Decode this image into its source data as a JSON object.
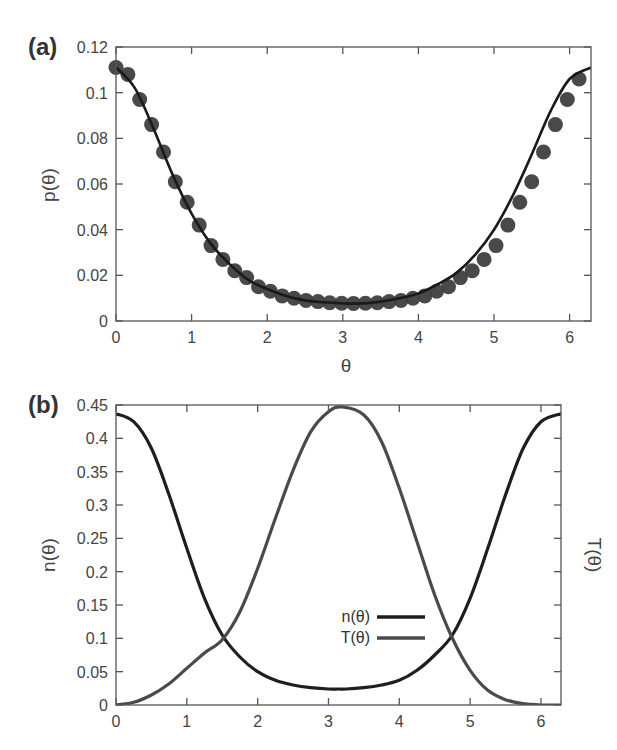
{
  "chart_data": [
    {
      "panel": "(a)",
      "type": "scatter",
      "title": "",
      "xlabel": "θ",
      "ylabel": "p(θ)",
      "xlim": [
        0,
        6.283
      ],
      "ylim": [
        0,
        0.12
      ],
      "xticks": [
        0,
        1,
        2,
        3,
        4,
        5,
        6
      ],
      "yticks": [
        0,
        0.02,
        0.04,
        0.06,
        0.08,
        0.1,
        0.12
      ],
      "ytick_labels": [
        "0",
        "0.02",
        "0.04",
        "0.06",
        "0.08",
        "0.1",
        "0.12"
      ],
      "grid": false,
      "legend": null,
      "series": [
        {
          "name": "data points",
          "style": "markers",
          "color": "#3f3f3f",
          "x": [
            0.0,
            0.157,
            0.314,
            0.471,
            0.628,
            0.785,
            0.942,
            1.1,
            1.257,
            1.414,
            1.571,
            1.728,
            1.885,
            2.042,
            2.199,
            2.356,
            2.513,
            2.67,
            2.827,
            2.985,
            3.142,
            3.299,
            3.456,
            3.613,
            3.77,
            3.927,
            4.084,
            4.241,
            4.398,
            4.555,
            4.712,
            4.869,
            5.027,
            5.184,
            5.341,
            5.498,
            5.655,
            5.812,
            5.969,
            6.126
          ],
          "y": [
            0.111,
            0.108,
            0.097,
            0.086,
            0.074,
            0.061,
            0.052,
            0.042,
            0.033,
            0.027,
            0.022,
            0.019,
            0.015,
            0.013,
            0.011,
            0.01,
            0.009,
            0.0085,
            0.008,
            0.0078,
            0.0077,
            0.0078,
            0.008,
            0.0085,
            0.009,
            0.01,
            0.011,
            0.013,
            0.015,
            0.019,
            0.022,
            0.027,
            0.033,
            0.042,
            0.052,
            0.061,
            0.074,
            0.086,
            0.097,
            0.106
          ]
        },
        {
          "name": "fit",
          "style": "line",
          "color": "#1a1a1a",
          "x": [
            0.0,
            0.25,
            0.5,
            0.75,
            1.0,
            1.25,
            1.5,
            1.75,
            2.0,
            2.25,
            2.5,
            2.75,
            3.0,
            3.14,
            3.25,
            3.5,
            3.75,
            4.0,
            4.25,
            4.5,
            4.75,
            5.0,
            5.25,
            5.5,
            5.75,
            6.0,
            6.283
          ],
          "y": [
            0.111,
            0.102,
            0.084,
            0.064,
            0.047,
            0.034,
            0.025,
            0.018,
            0.014,
            0.011,
            0.009,
            0.0082,
            0.0077,
            0.0076,
            0.0077,
            0.0085,
            0.01,
            0.012,
            0.016,
            0.021,
            0.029,
            0.04,
            0.055,
            0.073,
            0.092,
            0.106,
            0.111
          ]
        }
      ]
    },
    {
      "panel": "(b)",
      "type": "line",
      "title": "",
      "xlabel": "",
      "ylabel": "n(θ)",
      "ylabel_right": "T(θ)",
      "xlim": [
        0,
        6.283
      ],
      "ylim": [
        0,
        0.45
      ],
      "xticks": [
        0,
        1,
        2,
        3,
        4,
        5,
        6
      ],
      "yticks": [
        0,
        0.05,
        0.1,
        0.15,
        0.2,
        0.25,
        0.3,
        0.35,
        0.4,
        0.45
      ],
      "ytick_labels": [
        "0",
        "0.05",
        "0.1",
        "0.15",
        "0.2",
        "0.25",
        "0.3",
        "0.35",
        "0.4",
        "0.45"
      ],
      "grid": false,
      "legend": {
        "position": "center-right",
        "entries": [
          "n(θ)",
          "T(θ)"
        ]
      },
      "series": [
        {
          "name": "n(θ)",
          "color": "#1e1e1e",
          "x": [
            0.0,
            0.25,
            0.5,
            0.75,
            1.0,
            1.25,
            1.5,
            1.75,
            2.0,
            2.25,
            2.5,
            2.75,
            3.0,
            3.14,
            3.25,
            3.5,
            3.75,
            4.0,
            4.25,
            4.5,
            4.75,
            5.0,
            5.25,
            5.5,
            5.75,
            6.0,
            6.283
          ],
          "y": [
            0.437,
            0.425,
            0.385,
            0.315,
            0.235,
            0.16,
            0.105,
            0.072,
            0.05,
            0.037,
            0.03,
            0.026,
            0.024,
            0.024,
            0.024,
            0.026,
            0.03,
            0.037,
            0.052,
            0.075,
            0.105,
            0.16,
            0.235,
            0.315,
            0.385,
            0.425,
            0.437
          ]
        },
        {
          "name": "T(θ)",
          "color": "#4a4a4a",
          "x": [
            0.0,
            0.25,
            0.5,
            0.75,
            1.0,
            1.25,
            1.5,
            1.75,
            2.0,
            2.25,
            2.5,
            2.75,
            3.0,
            3.2,
            3.5,
            3.75,
            4.0,
            4.25,
            4.5,
            4.75,
            5.0,
            5.25,
            5.5,
            5.75,
            6.0,
            6.283
          ],
          "y": [
            0.0,
            0.004,
            0.015,
            0.032,
            0.055,
            0.078,
            0.098,
            0.14,
            0.205,
            0.28,
            0.352,
            0.41,
            0.44,
            0.447,
            0.435,
            0.395,
            0.325,
            0.245,
            0.165,
            0.1,
            0.052,
            0.022,
            0.008,
            0.002,
            0.0,
            0.0
          ]
        }
      ]
    }
  ],
  "figure": {
    "panel_a_label": "(a)",
    "panel_b_label": "(b)"
  }
}
